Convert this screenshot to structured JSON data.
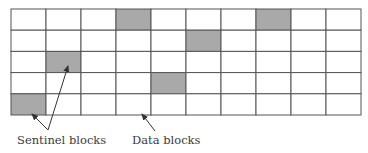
{
  "diagram": {
    "grid": {
      "rows": 5,
      "cols": 10,
      "x": 11,
      "y": 9,
      "cell_width": 35,
      "cell_height": 21.2,
      "line_color": "#555555",
      "fill_empty": "#ffffff",
      "fill_sentinel": "#a9a9a9",
      "sentinel_cells": [
        {
          "row": 0,
          "col": 3
        },
        {
          "row": 0,
          "col": 7
        },
        {
          "row": 1,
          "col": 5
        },
        {
          "row": 2,
          "col": 1
        },
        {
          "row": 3,
          "col": 4
        },
        {
          "row": 4,
          "col": 0
        }
      ]
    },
    "labels": {
      "sentinel": "Sentinel blocks",
      "data": "Data blocks"
    },
    "arrows": [
      {
        "name": "sentinel-arrow-1",
        "from": [
          48,
          130
        ],
        "to": [
          32,
          114
        ]
      },
      {
        "name": "sentinel-arrow-2",
        "from": [
          48,
          130
        ],
        "to": [
          68,
          66
        ]
      },
      {
        "name": "data-arrow",
        "from": [
          155,
          131
        ],
        "to": [
          142,
          114
        ]
      }
    ]
  }
}
